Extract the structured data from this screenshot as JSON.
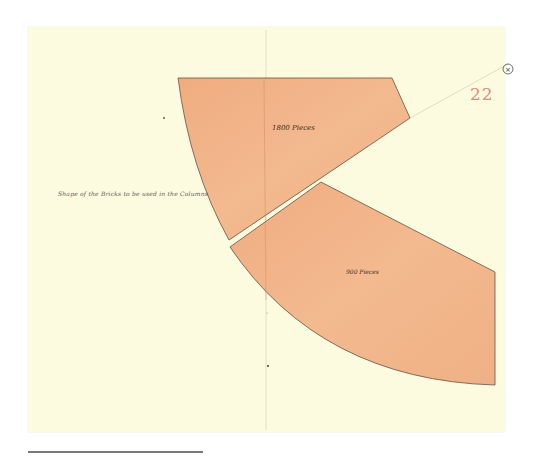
{
  "document": {
    "type": "architectural drawing",
    "sheet_number": "22",
    "caption": "Shape of the Bricks to be used in the Columns",
    "shapes": [
      {
        "id": "upper-wedge",
        "label": "1800 Pieces"
      },
      {
        "id": "lower-wedge",
        "label": "900 Pieces"
      }
    ],
    "center_marker": "×"
  },
  "colors": {
    "paper": "#fcfbdf",
    "wedge_fill": "#f2b58a",
    "wedge_outline": "#6a5140",
    "sheet_number": "#e08a7a",
    "ink": "#3a2e22"
  }
}
